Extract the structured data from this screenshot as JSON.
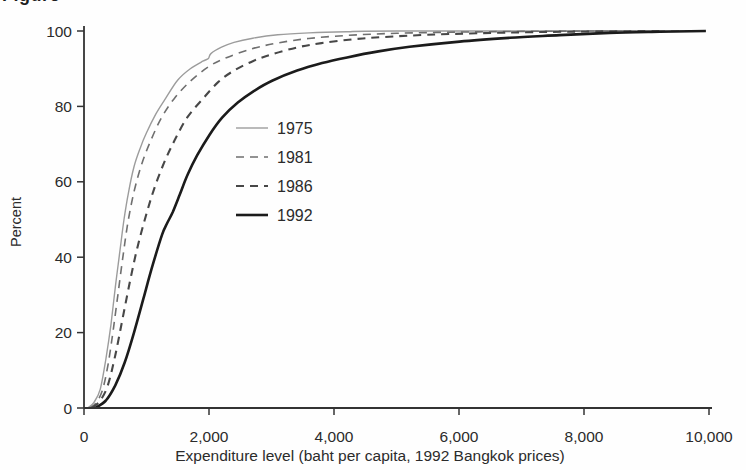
{
  "figure": {
    "cropped_title_fragment": "Figure"
  },
  "chart_data": {
    "type": "line",
    "title": "",
    "xlabel": "Expenditure level (baht per capita, 1992 Bangkok prices)",
    "ylabel": "Percent",
    "xlim": [
      0,
      10000
    ],
    "ylim": [
      0,
      100
    ],
    "x_tick_values": [
      0,
      2000,
      4000,
      6000,
      8000,
      10000
    ],
    "x_tick_labels": [
      "0",
      "2,000",
      "4,000",
      "6,000",
      "8,000",
      "10,000"
    ],
    "y_tick_values": [
      0,
      20,
      40,
      60,
      80,
      100
    ],
    "y_tick_labels": [
      "0",
      "20",
      "40",
      "60",
      "80",
      "100"
    ],
    "grid": false,
    "legend_position": "inside-center-left",
    "axis_color": "#333333",
    "text_color": "#2b2b2b",
    "series": [
      {
        "name": "1975",
        "style": "solid",
        "color": "#9c9c9c",
        "width": 1.4,
        "dash": "",
        "points": [
          [
            60,
            0
          ],
          [
            160,
            1.5
          ],
          [
            260,
            5
          ],
          [
            350,
            13
          ],
          [
            430,
            22
          ],
          [
            500,
            32
          ],
          [
            570,
            41
          ],
          [
            640,
            50
          ],
          [
            710,
            57
          ],
          [
            800,
            64
          ],
          [
            900,
            69
          ],
          [
            1000,
            73
          ],
          [
            1150,
            78
          ],
          [
            1300,
            82
          ],
          [
            1500,
            87
          ],
          [
            1700,
            90
          ],
          [
            1900,
            92
          ],
          [
            1990,
            92.7
          ],
          [
            2030,
            94
          ],
          [
            2200,
            95.7
          ],
          [
            2400,
            97
          ],
          [
            2700,
            98.1
          ],
          [
            3100,
            99
          ],
          [
            3600,
            99.5
          ],
          [
            4200,
            99.8
          ],
          [
            5000,
            100
          ],
          [
            9850,
            100
          ]
        ]
      },
      {
        "name": "1981",
        "style": "dashed",
        "color": "#6f6f6f",
        "width": 1.6,
        "dash": "8 6",
        "points": [
          [
            90,
            0
          ],
          [
            200,
            1.5
          ],
          [
            300,
            5
          ],
          [
            390,
            12
          ],
          [
            470,
            21
          ],
          [
            550,
            31
          ],
          [
            630,
            41
          ],
          [
            710,
            50
          ],
          [
            810,
            58
          ],
          [
            930,
            65
          ],
          [
            1070,
            71
          ],
          [
            1240,
            77
          ],
          [
            1440,
            82
          ],
          [
            1690,
            86.5
          ],
          [
            1990,
            90.5
          ],
          [
            2290,
            93
          ],
          [
            2690,
            95.3
          ],
          [
            3090,
            96.8
          ],
          [
            3590,
            98
          ],
          [
            4190,
            98.8
          ],
          [
            5000,
            99.4
          ],
          [
            6000,
            99.7
          ],
          [
            7000,
            99.9
          ],
          [
            8200,
            100
          ],
          [
            9850,
            100
          ]
        ]
      },
      {
        "name": "1986",
        "style": "dashed",
        "color": "#474747",
        "width": 2.1,
        "dash": "8 6",
        "points": [
          [
            130,
            0
          ],
          [
            260,
            2
          ],
          [
            380,
            6
          ],
          [
            500,
            14
          ],
          [
            620,
            24
          ],
          [
            740,
            34
          ],
          [
            860,
            43
          ],
          [
            990,
            51
          ],
          [
            1120,
            58
          ],
          [
            1280,
            65
          ],
          [
            1450,
            71
          ],
          [
            1650,
            77
          ],
          [
            1900,
            82
          ],
          [
            2150,
            86.5
          ],
          [
            2400,
            89.5
          ],
          [
            2700,
            92
          ],
          [
            3000,
            93.8
          ],
          [
            3400,
            95.6
          ],
          [
            3800,
            96.8
          ],
          [
            4300,
            97.8
          ],
          [
            4800,
            98.4
          ],
          [
            5500,
            99
          ],
          [
            6300,
            99.4
          ],
          [
            7200,
            99.7
          ],
          [
            8200,
            99.9
          ],
          [
            9300,
            100
          ]
        ]
      },
      {
        "name": "1992",
        "style": "solid",
        "color": "#1b1b1b",
        "width": 2.6,
        "dash": "",
        "points": [
          [
            180,
            0
          ],
          [
            350,
            2
          ],
          [
            500,
            6
          ],
          [
            650,
            12
          ],
          [
            800,
            20
          ],
          [
            950,
            29
          ],
          [
            1100,
            38
          ],
          [
            1250,
            46
          ],
          [
            1330,
            49
          ],
          [
            1420,
            52
          ],
          [
            1530,
            56.5
          ],
          [
            1660,
            62
          ],
          [
            1810,
            67
          ],
          [
            2010,
            72.5
          ],
          [
            2210,
            77
          ],
          [
            2460,
            81
          ],
          [
            2710,
            84
          ],
          [
            3010,
            86.8
          ],
          [
            3410,
            89.5
          ],
          [
            3810,
            91.5
          ],
          [
            4210,
            93
          ],
          [
            4710,
            94.6
          ],
          [
            5210,
            95.8
          ],
          [
            6010,
            97.2
          ],
          [
            6810,
            98.2
          ],
          [
            7610,
            98.9
          ],
          [
            8410,
            99.5
          ],
          [
            9210,
            99.8
          ],
          [
            9950,
            100
          ]
        ]
      }
    ]
  }
}
